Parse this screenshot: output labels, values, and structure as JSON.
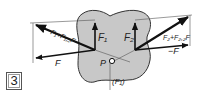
{
  "figure": {
    "number": "3",
    "colors": {
      "body_fill": "#c8c8c8",
      "body_stroke": "#333333",
      "vector": "#111111",
      "construction_line": "#555555"
    },
    "labels": {
      "f1": "F₁",
      "f2": "F₂",
      "f_left": "F",
      "f_right": "−F",
      "resultant_left": "F₁+F₁,₂F",
      "resultant_right": "F₂+F₂,₂F",
      "point": "P",
      "reaction": "(F₁)"
    }
  }
}
